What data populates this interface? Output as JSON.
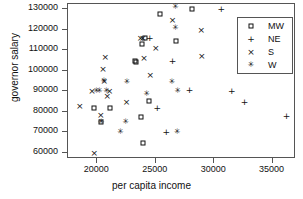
{
  "chart_data": {
    "type": "scatter",
    "title": "",
    "xlabel": "per capita income",
    "ylabel": "governor salary",
    "xlim": [
      17500,
      37000
    ],
    "ylim": [
      57000,
      132500
    ],
    "xticks": [
      20000,
      25000,
      30000,
      35000
    ],
    "yticks": [
      60000,
      70000,
      80000,
      90000,
      100000,
      110000,
      120000,
      130000
    ],
    "grid": false,
    "legend_position": "top-right",
    "legend": [
      {
        "label": "MW",
        "marker": "square"
      },
      {
        "label": "NE",
        "marker": "plus"
      },
      {
        "label": "S",
        "marker": "cross"
      },
      {
        "label": "W",
        "marker": "asterisk"
      }
    ],
    "series": [
      {
        "name": "MW",
        "marker": "square",
        "points": [
          [
            19700,
            82000
          ],
          [
            20350,
            75000
          ],
          [
            21100,
            82000
          ],
          [
            23200,
            105000
          ],
          [
            23350,
            104500
          ],
          [
            23700,
            77500
          ],
          [
            23800,
            113000
          ],
          [
            23950,
            64800
          ],
          [
            24100,
            116000
          ],
          [
            24400,
            85500
          ],
          [
            25400,
            127500
          ],
          [
            26700,
            114500
          ],
          [
            28100,
            130000
          ]
        ]
      },
      {
        "name": "NE",
        "marker": "plus",
        "points": [
          [
            24500,
            116000
          ],
          [
            25150,
            82000
          ],
          [
            25900,
            70000
          ],
          [
            26450,
            105000
          ],
          [
            27900,
            90500
          ],
          [
            30600,
            130000
          ],
          [
            31500,
            90000
          ],
          [
            32600,
            85000
          ],
          [
            36200,
            78200
          ]
        ]
      },
      {
        "name": "S",
        "marker": "cross",
        "points": [
          [
            18500,
            83000
          ],
          [
            19550,
            90000
          ],
          [
            19750,
            60100
          ],
          [
            20300,
            78500
          ],
          [
            20500,
            101000
          ],
          [
            20600,
            95000
          ],
          [
            20700,
            106500
          ],
          [
            20850,
            87500
          ],
          [
            21050,
            90000
          ],
          [
            22500,
            85000
          ],
          [
            23700,
            116000
          ],
          [
            23900,
            116000
          ],
          [
            24000,
            106000
          ],
          [
            24550,
            98000
          ],
          [
            25000,
            111000
          ],
          [
            26450,
            124500
          ],
          [
            28900,
            120000
          ],
          [
            28950,
            107000
          ]
        ]
      },
      {
        "name": "W",
        "marker": "asterisk",
        "points": [
          [
            19950,
            90000
          ],
          [
            20200,
            90000
          ],
          [
            20350,
            75000
          ],
          [
            20600,
            95000
          ],
          [
            20800,
            90000
          ],
          [
            22450,
            75200
          ],
          [
            22550,
            94500
          ],
          [
            22000,
            70000
          ],
          [
            24250,
            88500
          ],
          [
            26400,
            94500
          ],
          [
            26700,
            131000
          ],
          [
            26700,
            121000
          ],
          [
            26900,
            90000
          ],
          [
            26850,
            70000
          ]
        ]
      }
    ]
  }
}
